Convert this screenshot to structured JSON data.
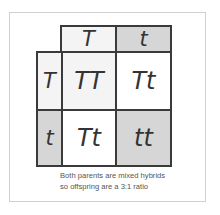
{
  "diagram": {
    "type": "punnett-square",
    "column_headers": [
      "T",
      "t"
    ],
    "row_headers": [
      "T",
      "t"
    ],
    "cells": [
      [
        "TT",
        "Tt"
      ],
      [
        "Tt",
        "tt"
      ]
    ],
    "caption_lines": [
      "Both parents are mixed hybrids",
      "so offspring are a 3:1 ratio"
    ],
    "colors": {
      "border": "#3a3a3a",
      "shaded": "#d6d6d6",
      "light": "#f4f4f4",
      "white": "#ffffff",
      "text": "#333333"
    }
  }
}
